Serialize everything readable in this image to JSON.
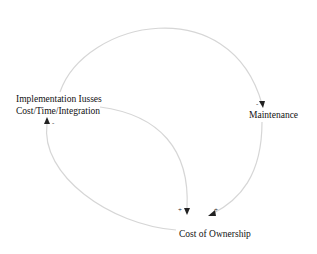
{
  "diagram": {
    "type": "causal-loop",
    "nodes": [
      {
        "id": "impl",
        "label_line1": "Implementation Iusses",
        "label_line2": "Cost/Time/Integration"
      },
      {
        "id": "maint",
        "label": "Maintenance"
      },
      {
        "id": "cost",
        "label": "Cost of Ownership"
      }
    ],
    "links": [
      {
        "from": "impl",
        "to": "maint",
        "polarity": "-"
      },
      {
        "from": "maint",
        "to": "cost",
        "polarity": "+"
      },
      {
        "from": "impl",
        "to": "cost",
        "polarity": "+"
      },
      {
        "from": "cost",
        "to": "impl",
        "polarity": "-"
      }
    ],
    "colors": {
      "link": "#d6d6d6",
      "arrow": "#222222",
      "text": "#111111"
    }
  }
}
